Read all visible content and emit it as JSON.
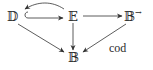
{
  "diagram": {
    "nodes": {
      "D": {
        "label": "𝔻",
        "x": 7,
        "y": 10
      },
      "E": {
        "label": "𝔼",
        "x": 68,
        "y": 10
      },
      "Barrow": {
        "label": "𝔹",
        "sup": "→",
        "x": 125,
        "y": 10
      },
      "B": {
        "label": "𝔹",
        "x": 68,
        "y": 51
      }
    },
    "edges": [
      {
        "from": "E",
        "to": "D",
        "style": "curved-over",
        "label": ""
      },
      {
        "from": "D",
        "to": "E",
        "style": "hook-inclusion",
        "label": ""
      },
      {
        "from": "E",
        "to": "Barrow",
        "style": "straight",
        "label": ""
      },
      {
        "from": "D",
        "to": "B",
        "style": "straight",
        "label": ""
      },
      {
        "from": "E",
        "to": "B",
        "style": "straight",
        "label": ""
      },
      {
        "from": "Barrow",
        "to": "B",
        "style": "straight",
        "label": "cod"
      }
    ],
    "labels": {
      "cod": "cod"
    },
    "stroke_color": "#333333"
  }
}
